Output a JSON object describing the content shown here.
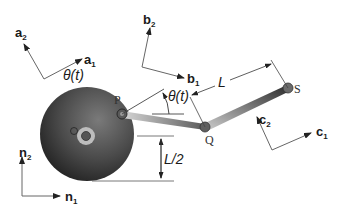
{
  "diagram": {
    "type": "mechanism",
    "frames": [
      {
        "name": "a",
        "axis1": "a",
        "axis1_sub": "1",
        "axis2": "a",
        "axis2_sub": "2"
      },
      {
        "name": "b",
        "axis1": "b",
        "axis1_sub": "1",
        "axis2": "b",
        "axis2_sub": "2"
      },
      {
        "name": "c",
        "axis1": "c",
        "axis1_sub": "1",
        "axis2": "c",
        "axis2_sub": "2"
      },
      {
        "name": "n",
        "axis1": "n",
        "axis1_sub": "1",
        "axis2": "n",
        "axis2_sub": "2"
      }
    ],
    "points": {
      "P": "P",
      "Q": "Q",
      "S": "S",
      "O": "O"
    },
    "labels": {
      "theta_a": "θ(t)",
      "theta_b": "θ(t)",
      "length": "L",
      "half_length": "L/2"
    },
    "colors": {
      "disk_dark": "#2e2e2e",
      "disk_mid": "#6a6a6a",
      "link_light": "#c8c8c8",
      "link_dark": "#3a3a3a",
      "hub": "#bdbdbd",
      "line": "#555555"
    }
  }
}
